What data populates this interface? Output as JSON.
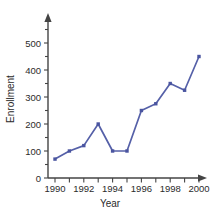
{
  "chart_data": {
    "type": "line",
    "title": "",
    "xlabel": "Year",
    "ylabel": "Enrollment",
    "x": [
      1990,
      1991,
      1992,
      1993,
      1994,
      1995,
      1996,
      1997,
      1998,
      1999,
      2000
    ],
    "values": [
      70,
      100,
      120,
      200,
      100,
      100,
      250,
      275,
      350,
      325,
      450
    ],
    "series": [
      {
        "name": "Enrollment",
        "values": [
          70,
          100,
          120,
          200,
          100,
          100,
          250,
          275,
          350,
          325,
          450
        ]
      }
    ],
    "xlim": [
      1990,
      2000
    ],
    "ylim": [
      0,
      550
    ],
    "y_ticks": [
      0,
      100,
      200,
      300,
      400,
      500
    ],
    "y_tick_labels": [
      "0",
      "100",
      "200",
      "300",
      "400",
      "500"
    ],
    "y_minor_ticks": [
      50,
      150,
      250,
      350,
      450,
      550
    ],
    "x_ticks": [
      1990,
      1991,
      1992,
      1993,
      1994,
      1995,
      1996,
      1997,
      1998,
      1999,
      2000
    ],
    "x_tick_labels": [
      "1990",
      "",
      "1992",
      "",
      "1994",
      "",
      "1996",
      "",
      "1998",
      "",
      "2000"
    ],
    "grid": false,
    "legend": false,
    "markers": true,
    "line_color": "#5560a8",
    "marker_color": "#4a55a0",
    "axis_color": "#444444",
    "background_color": "#ffffff"
  },
  "labels": {
    "y_axis_title": "Enrollment",
    "x_axis_title": "Year"
  },
  "icons": {
    "y_axis_arrow": "arrow-up-icon",
    "x_axis_arrow": "arrow-right-icon"
  }
}
